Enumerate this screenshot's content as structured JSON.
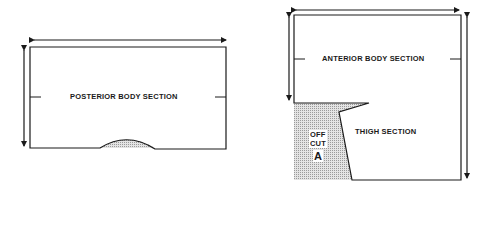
{
  "diagram": {
    "posterior": {
      "label": "POSTERIOR BODY SECTION"
    },
    "anterior": {
      "label": "ANTERIOR BODY SECTION"
    },
    "thigh": {
      "label": "THIGH SECTION"
    },
    "offcut": {
      "line1": "OFF",
      "line2": "CUT",
      "letter": "A"
    },
    "colors": {
      "stroke": "#1a1a1a",
      "shade": "#b8b8b8"
    }
  }
}
